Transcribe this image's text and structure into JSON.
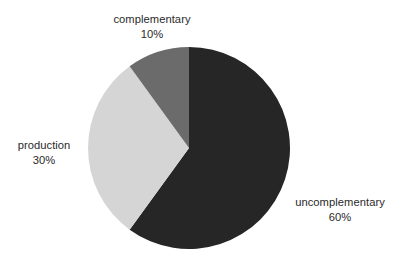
{
  "chart_data": {
    "type": "pie",
    "title": "",
    "subtitle": "",
    "xlabel": "",
    "ylabel": "",
    "legend_position": "none",
    "grid": false,
    "labels_inline": true,
    "start_angle_deg": 0,
    "direction": "clockwise",
    "background_color": "#ffffff",
    "text_color": "#2a2a2a",
    "categories": [
      "uncomplementary",
      "production",
      "complementary"
    ],
    "values": [
      60,
      30,
      10
    ],
    "value_suffix": "%",
    "slices": [
      {
        "name": "uncomplementary",
        "value": 60,
        "value_label": "60%",
        "color": "#262626",
        "start_deg": 0,
        "end_deg": 216,
        "label_position": "right"
      },
      {
        "name": "production",
        "value": 30,
        "value_label": "30%",
        "color": "#d5d5d5",
        "start_deg": 216,
        "end_deg": 324,
        "label_position": "left"
      },
      {
        "name": "complementary",
        "value": 10,
        "value_label": "10%",
        "color": "#6b6b6b",
        "start_deg": 324,
        "end_deg": 360,
        "label_position": "top"
      }
    ]
  },
  "labels": {
    "complementary": {
      "name": "complementary",
      "value": "10%"
    },
    "production": {
      "name": "production",
      "value": "30%"
    },
    "uncomplementary": {
      "name": "uncomplementary",
      "value": "60%"
    }
  },
  "colors": {
    "slice_uncomplementary": "#262626",
    "slice_production": "#d5d5d5",
    "slice_complementary": "#6b6b6b",
    "background": "#ffffff",
    "text": "#2a2a2a"
  }
}
